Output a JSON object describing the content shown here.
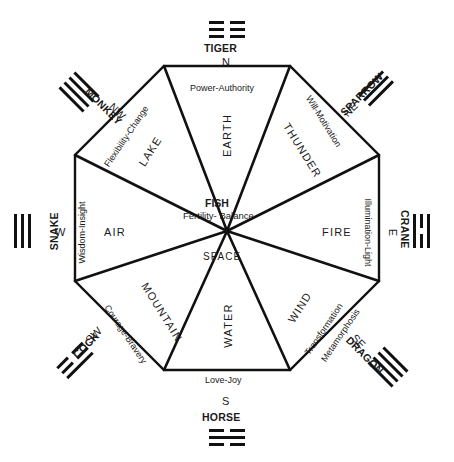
{
  "diagram": {
    "center": {
      "name": "FISH",
      "attribute": "Fertility- Balance",
      "element": "SPACE"
    },
    "geometry": {
      "cx": 227,
      "cy": 231,
      "radius": 165,
      "sides": 8
    },
    "colors": {
      "stroke": "#111111",
      "text": "#1a1a1a",
      "background": "#ffffff"
    },
    "sectors": [
      {
        "direction": "N",
        "animal": "TIGER",
        "element": "EARTH",
        "attribute": "Power-Authority",
        "trigram": "broken,broken,broken",
        "angle": 0
      },
      {
        "direction": "NE",
        "animal": "SPARROW",
        "element": "THUNDER",
        "attribute": "Will-Motivation",
        "trigram": "solid,solid,solid",
        "angle": 45
      },
      {
        "direction": "E",
        "animal": "CRANE",
        "element": "FIRE",
        "attribute": "Illumination-Light",
        "trigram": "solid,broken,solid",
        "angle": 90
      },
      {
        "direction": "SE",
        "animal": "DRAGON",
        "element": "WIND",
        "attribute": "Transformation-Metamorphosis",
        "trigram": "solid,solid,solid",
        "angle": 135
      },
      {
        "direction": "S",
        "animal": "HORSE",
        "element": "WATER",
        "attribute": "Love-Joy",
        "trigram": "broken,solid,broken",
        "angle": 180
      },
      {
        "direction": "SW",
        "animal": "COCK",
        "element": "MOUNTAIN",
        "attribute": "Courage-Bravery",
        "trigram": "broken,broken,solid",
        "angle": 225
      },
      {
        "direction": "W",
        "animal": "SNAKE",
        "element": "AIR",
        "attribute": "Wisdom-Insight",
        "trigram": "solid,solid,solid",
        "angle": 270
      },
      {
        "direction": "NW",
        "animal": "MONKEY",
        "element": "LAKE",
        "attribute": "Flexibility-Change",
        "trigram": "solid,solid,solid",
        "angle": 315
      }
    ],
    "attribute_split": {
      "se_line1": "Transformation",
      "se_line2": "Metamorphosis"
    }
  }
}
